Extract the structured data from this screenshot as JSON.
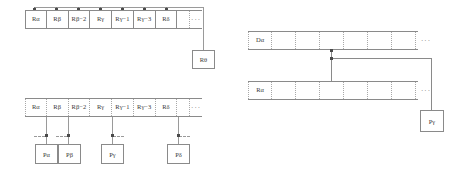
{
  "figure": {
    "background_color": "#ffffff",
    "line_color": "#8a8a8a",
    "text_color": "#3a3a3a",
    "panels": [
      {
        "id": "top-left",
        "name": "register-tape-with-theta-box",
        "tape_label_row": [
          "Rα",
          "Rβ",
          "Rβ−2",
          "Rγ",
          "Rγ−1",
          "Rγ−3",
          "Rδ"
        ],
        "ellipsis": "···",
        "node_label": "Rθ"
      },
      {
        "id": "bottom-left",
        "name": "register-tape-with-p-boxes",
        "tape_label_row": [
          "Rα",
          "Rβ",
          "Rβ−2",
          "Rγ",
          "Rγ−1",
          "Rγ−3",
          "Rδ"
        ],
        "ellipsis": "···",
        "node_labels": [
          "Pα",
          "Pβ",
          "Pγ",
          "Pδ"
        ]
      },
      {
        "id": "right",
        "name": "d-row-r-row-with-p-gamma",
        "top_row_label": "Dα",
        "bottom_row_label": "Rα",
        "ellipsis": "···",
        "node_label": "Pγ"
      }
    ]
  },
  "topleft": {
    "cells": [
      {
        "label": "Rα"
      },
      {
        "label": "Rβ"
      },
      {
        "label": "Rβ−2"
      },
      {
        "label": "Rγ"
      },
      {
        "label": "Rγ−1"
      },
      {
        "label": "Rγ−3"
      },
      {
        "label": "Rδ"
      },
      {
        "label": ""
      }
    ],
    "ellipsis": "···",
    "box": "Rθ"
  },
  "bottomleft": {
    "cells": [
      {
        "label": "Rα"
      },
      {
        "label": "Rβ"
      },
      {
        "label": "Rβ−2"
      },
      {
        "label": "Rγ"
      },
      {
        "label": "Rγ−1"
      },
      {
        "label": "Rγ−3"
      },
      {
        "label": "Rδ"
      },
      {
        "label": ""
      }
    ],
    "ellipsis": "···",
    "boxes": [
      {
        "label": "Pα"
      },
      {
        "label": "Pβ"
      },
      {
        "label": "Pγ"
      },
      {
        "label": "Pδ"
      }
    ]
  },
  "right": {
    "top_cells": [
      {
        "label": "Dα"
      },
      {
        "label": ""
      },
      {
        "label": ""
      },
      {
        "label": ""
      },
      {
        "label": ""
      },
      {
        "label": ""
      },
      {
        "label": ""
      }
    ],
    "bottom_cells": [
      {
        "label": "Rα"
      },
      {
        "label": ""
      },
      {
        "label": ""
      },
      {
        "label": ""
      },
      {
        "label": ""
      },
      {
        "label": ""
      },
      {
        "label": ""
      }
    ],
    "ellipsis_top": "···",
    "ellipsis_bottom": "···",
    "box": "Pγ"
  }
}
